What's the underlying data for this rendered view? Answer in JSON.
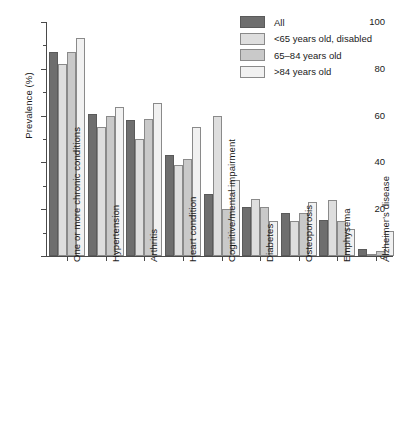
{
  "chart_data": {
    "type": "bar",
    "title": "",
    "xlabel": "",
    "ylabel": "Prevalence (%)",
    "ylim": [
      0,
      100
    ],
    "yticks": [
      0,
      20,
      40,
      60,
      80,
      100
    ],
    "yticks_minor": [
      10,
      30,
      50,
      70,
      90
    ],
    "grid": false,
    "legend_position": "top-right",
    "categories": [
      "One or more chronic conditions",
      "Hypertension",
      "Arthritis",
      "Heart condition",
      "Cognitive/mental impairment",
      "Diabetes",
      "Osteoporosis",
      "Emphysema",
      "Alzheimer's disease"
    ],
    "series": [
      {
        "name": "All",
        "color": "#6e6e6e",
        "values": [
          87,
          60.5,
          58,
          43,
          26.5,
          21,
          18.5,
          15.5,
          3
        ]
      },
      {
        "name": "<65 years old, disabled",
        "color": "#dedede",
        "values": [
          82,
          55,
          50,
          39,
          60,
          24.5,
          15,
          24,
          0.5
        ]
      },
      {
        "name": "65–84 years old",
        "color": "#c9c9c9",
        "values": [
          87,
          60,
          58.5,
          41.5,
          20,
          21,
          18.5,
          15,
          2
        ]
      },
      {
        "name": ">84 years old",
        "color": "#f1f1f1",
        "values": [
          93,
          63.5,
          65.5,
          55,
          32.5,
          15,
          23,
          11.5,
          10.5
        ]
      }
    ]
  },
  "legend": {
    "items": [
      {
        "label": "All",
        "color": "#6e6e6e"
      },
      {
        "label": "<65 years old, disabled",
        "color": "#dedede"
      },
      {
        "label": "65–84 years old",
        "color": "#c9c9c9"
      },
      {
        "label": ">84 years old",
        "color": "#f1f1f1"
      }
    ]
  }
}
